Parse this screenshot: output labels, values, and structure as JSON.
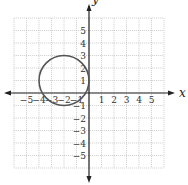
{
  "chart_data": {
    "type": "line",
    "title": "",
    "xlabel": "x",
    "ylabel": "y",
    "xlim": [
      -6,
      6
    ],
    "ylim": [
      -6,
      6
    ],
    "grid": true,
    "x_ticks": [
      -5,
      -4,
      -3,
      -2,
      -1,
      1,
      2,
      3,
      4,
      5
    ],
    "y_ticks": [
      -5,
      -4,
      -3,
      -2,
      -1,
      1,
      2,
      3,
      4,
      5
    ],
    "x_tick_labels": [
      "−5",
      "−4",
      "−3",
      "−2",
      "−1",
      "1",
      "2",
      "3",
      "4",
      "5"
    ],
    "y_tick_labels": [
      "−5",
      "−4",
      "−3",
      "−2",
      "−1",
      "1",
      "2",
      "3",
      "4",
      "5"
    ],
    "series": [
      {
        "name": "circle",
        "shape": "circle",
        "center": [
          -2,
          1
        ],
        "radius": 2,
        "color": "#555555"
      }
    ]
  },
  "axes": {
    "x_label": "x",
    "y_label": "y"
  }
}
